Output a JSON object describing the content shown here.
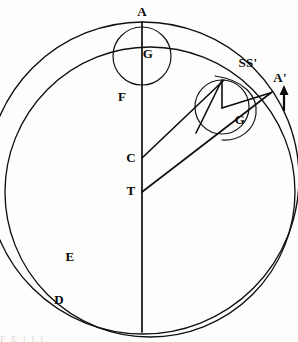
{
  "figure": {
    "kind": "geometric-astronomical-diagram",
    "background_color": "#fdfdfb",
    "ink_color": "#0a0a0a",
    "caption_partial": "F             E       l                 l                 l"
  },
  "labels": [
    {
      "id": "A",
      "text": "A",
      "x": 142,
      "y": 16,
      "anchor": "middle"
    },
    {
      "id": "G1",
      "text": "G",
      "x": 148,
      "y": 58,
      "anchor": "middle"
    },
    {
      "id": "F",
      "text": "F",
      "x": 122,
      "y": 101,
      "anchor": "middle"
    },
    {
      "id": "SS",
      "text": "SS'",
      "x": 248,
      "y": 67,
      "anchor": "middle"
    },
    {
      "id": "Ap",
      "text": "A'",
      "x": 280,
      "y": 82,
      "anchor": "middle"
    },
    {
      "id": "G2",
      "text": "G",
      "x": 240,
      "y": 124,
      "anchor": "middle"
    },
    {
      "id": "C",
      "text": "C",
      "x": 131,
      "y": 162,
      "anchor": "middle"
    },
    {
      "id": "T",
      "text": "T",
      "x": 131,
      "y": 195,
      "anchor": "middle"
    },
    {
      "id": "E",
      "text": "E",
      "x": 70,
      "y": 261,
      "anchor": "middle"
    },
    {
      "id": "D",
      "text": "D",
      "x": 59,
      "y": 304,
      "anchor": "middle"
    }
  ],
  "geometry": {
    "outer_circle": {
      "name": "deferent-outer-circle",
      "cx": 143,
      "cy": 178,
      "r": 156
    },
    "inner_circle": {
      "name": "eccentric-inner-circle",
      "cx": 150,
      "cy": 192,
      "r": 145
    },
    "top_epicycle": {
      "name": "upper-epicycle",
      "cx": 142,
      "cy": 56,
      "r": 29
    },
    "right_epicycle": {
      "name": "right-epicycle",
      "cx": 222,
      "cy": 107,
      "r": 27
    },
    "vertical_axis": {
      "name": "apsidal-line",
      "x": 142,
      "y1": 22,
      "y2": 332
    },
    "point_C": {
      "x": 142,
      "y": 158
    },
    "point_T": {
      "x": 142,
      "y": 192
    },
    "point_SS": {
      "x": 222,
      "y": 80
    },
    "point_Ap": {
      "x": 270,
      "y": 93
    },
    "point_G2": {
      "x": 222,
      "y": 107
    }
  },
  "arrow": {
    "name": "direction-of-motion-arrow",
    "x": 284,
    "y_tail": 110,
    "y_head": 88,
    "direction": "up"
  }
}
